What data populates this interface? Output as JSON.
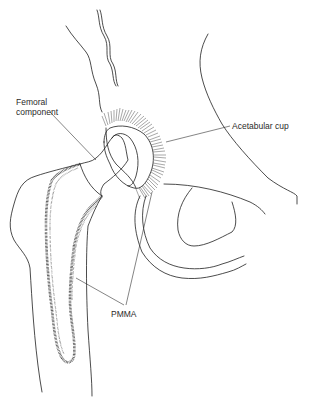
{
  "figure": {
    "type": "anatomical line drawing",
    "background_color": "#ffffff",
    "line_color": "#1e1e1e"
  },
  "labels": {
    "femoral_component": "Femoral component",
    "femoral_component_line1": "Femoral",
    "femoral_component_line2": "component",
    "acetabular_cup": "Acetabular cup",
    "pmma": "PMMA"
  }
}
